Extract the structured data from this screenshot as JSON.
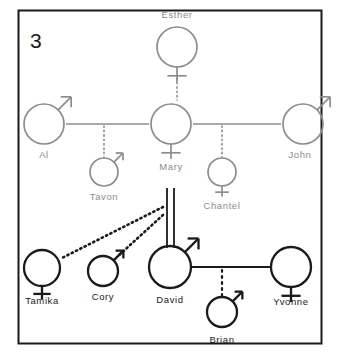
{
  "panel": {
    "number": "3",
    "border_color": "#1a1a1a",
    "background": "#ffffff"
  },
  "colors": {
    "generation_older": "#8c8c8c",
    "generation_focus": "#1a1a1a",
    "line_solid": "#8c8c8c",
    "line_solid_dark": "#1a1a1a",
    "dotted": "#8c8c8c",
    "dotted_dark": "#1a1a1a"
  },
  "people": [
    {
      "id": "esther",
      "label": "Esther",
      "gender": "female",
      "shade": "gray",
      "cx": 177,
      "cy": 47,
      "r": 20,
      "label_x": 177,
      "label_y": 18,
      "label_anchor": "middle"
    },
    {
      "id": "al",
      "label": "Al",
      "gender": "male",
      "shade": "gray",
      "cx": 44,
      "cy": 124,
      "r": 20,
      "label_x": 44,
      "label_y": 158,
      "label_anchor": "middle"
    },
    {
      "id": "mary",
      "label": "Mary",
      "gender": "female",
      "shade": "gray",
      "cx": 171,
      "cy": 124,
      "r": 20,
      "label_x": 171,
      "label_y": 170,
      "label_anchor": "middle"
    },
    {
      "id": "john",
      "label": "John",
      "gender": "male",
      "shade": "gray",
      "cx": 303,
      "cy": 124,
      "r": 20,
      "label_x": 300,
      "label_y": 158,
      "label_anchor": "middle"
    },
    {
      "id": "tavon",
      "label": "Tavon",
      "gender": "male",
      "shade": "gray",
      "cx": 104,
      "cy": 172,
      "r": 14,
      "label_x": 104,
      "label_y": 200,
      "label_anchor": "middle"
    },
    {
      "id": "chantel",
      "label": "Chantel",
      "gender": "female",
      "shade": "gray",
      "cx": 222,
      "cy": 172,
      "r": 14,
      "label_x": 222,
      "label_y": 209,
      "label_anchor": "middle"
    },
    {
      "id": "tamika",
      "label": "Tamika",
      "gender": "female",
      "shade": "black",
      "cx": 42,
      "cy": 268,
      "r": 18,
      "label_x": 42,
      "label_y": 304,
      "label_anchor": "middle"
    },
    {
      "id": "cory",
      "label": "Cory",
      "gender": "male",
      "shade": "black",
      "cx": 103,
      "cy": 271,
      "r": 15,
      "label_x": 103,
      "label_y": 300,
      "label_anchor": "middle"
    },
    {
      "id": "david",
      "label": "David",
      "gender": "male",
      "shade": "black",
      "cx": 170,
      "cy": 267,
      "r": 21,
      "label_x": 170,
      "label_y": 303,
      "label_anchor": "middle"
    },
    {
      "id": "yvonne",
      "label": "Yvonne",
      "gender": "female",
      "shade": "black",
      "cx": 291,
      "cy": 267,
      "r": 20,
      "label_x": 291,
      "label_y": 305,
      "label_anchor": "middle"
    },
    {
      "id": "brian",
      "label": "Brian",
      "gender": "male",
      "shade": "black",
      "cx": 222,
      "cy": 312,
      "r": 15,
      "label_x": 222,
      "label_y": 343,
      "label_anchor": "middle"
    }
  ],
  "connections": [
    {
      "id": "esther-mary",
      "kind": "dotted-vertical",
      "from": "esther",
      "to": "mary",
      "x": 177,
      "y1": 78,
      "y2": 100,
      "color": "#8c8c8c",
      "width": 1.6
    },
    {
      "id": "al-mary",
      "kind": "solid-horizontal",
      "from": "al",
      "to": "mary",
      "x1": 66,
      "x2": 149,
      "y": 124,
      "color": "#8c8c8c",
      "width": 1.6
    },
    {
      "id": "mary-john",
      "kind": "solid-horizontal",
      "from": "mary",
      "to": "john",
      "x1": 193,
      "x2": 281,
      "y": 124,
      "color": "#8c8c8c",
      "width": 1.6
    },
    {
      "id": "al-mary-tavon",
      "kind": "dotted-vertical",
      "from": "al-mary",
      "to": "tavon",
      "x": 104,
      "y1": 126,
      "y2": 157,
      "color": "#8c8c8c",
      "width": 1.6
    },
    {
      "id": "mary-john-chantel",
      "kind": "dotted-vertical",
      "from": "mary-john",
      "to": "chantel",
      "x": 222,
      "y1": 126,
      "y2": 157,
      "color": "#8c8c8c",
      "width": 1.6
    },
    {
      "id": "mary-david-twin-left",
      "kind": "solid-vertical",
      "from": "mary",
      "to": "david",
      "x": 167,
      "y1": 188,
      "y2": 248,
      "color": "#1a1a1a",
      "width": 1.8
    },
    {
      "id": "mary-david-twin-right",
      "kind": "solid-vertical",
      "from": "mary",
      "to": "david",
      "x": 174,
      "y1": 188,
      "y2": 248,
      "color": "#1a1a1a",
      "width": 1.8
    },
    {
      "id": "david-tamika",
      "kind": "dotted-diagonal",
      "from": "david",
      "to": "tamika",
      "x1": 163,
      "y1": 207,
      "x2": 62,
      "y2": 258,
      "color": "#1a1a1a",
      "width": 2.6
    },
    {
      "id": "david-cory",
      "kind": "dotted-diagonal",
      "from": "david",
      "to": "cory",
      "x1": 163,
      "y1": 215,
      "x2": 117,
      "y2": 257,
      "color": "#1a1a1a",
      "width": 2.6
    },
    {
      "id": "david-yvonne",
      "kind": "solid-horizontal",
      "from": "david",
      "to": "yvonne",
      "x1": 192,
      "x2": 270,
      "y": 267,
      "color": "#1a1a1a",
      "width": 2.0
    },
    {
      "id": "david-yvonne-brian",
      "kind": "dotted-vertical",
      "from": "david-yvonne",
      "to": "brian",
      "x": 222,
      "y1": 270,
      "y2": 296,
      "color": "#1a1a1a",
      "width": 2.2
    }
  ]
}
